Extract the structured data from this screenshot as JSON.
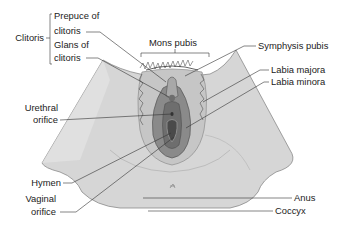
{
  "diagram": {
    "labels_left": {
      "clitoris_group": "Clitoris",
      "prepuce_line1": "Prepuce of",
      "prepuce_line2": "clitoris",
      "glans_line1": "Glans of",
      "glans_line2": "clitoris",
      "urethral_line1": "Urethral",
      "urethral_line2": "orifice",
      "hymen": "Hymen",
      "vaginal_line1": "Vaginal",
      "vaginal_line2": "orifice"
    },
    "labels_top": {
      "mons_pubis": "Mons pubis"
    },
    "labels_right": {
      "symphysis_pubis": "Symphysis pubis",
      "labia_majora": "Labia majora",
      "labia_minora": "Labia minora",
      "anus": "Anus",
      "coccyx": "Coccyx"
    },
    "colors": {
      "skin_light": "#d9d9d9",
      "skin_mid": "#c4c4c4",
      "tissue_dark": "#7a7a7a",
      "tissue_darker": "#555555",
      "leader_line": "#333333",
      "text": "#222222"
    }
  }
}
